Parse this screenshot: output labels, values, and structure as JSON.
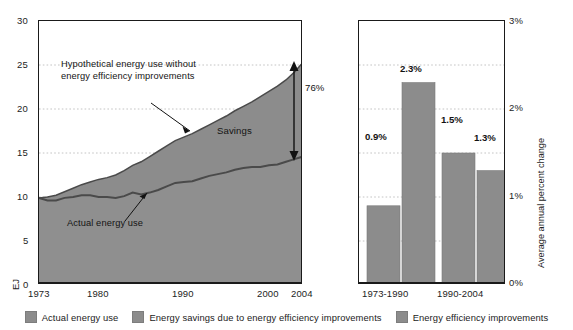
{
  "chart_data": [
    {
      "type": "area",
      "panel": "left",
      "title": "",
      "xlabel": "",
      "ylabel": "EJ",
      "xlim": [
        1973,
        2004
      ],
      "ylim": [
        0,
        30
      ],
      "xticks": [
        "1973",
        "1980",
        "1990",
        "2000",
        "2004"
      ],
      "xtick_values": [
        1973,
        1980,
        1990,
        2000,
        2004
      ],
      "yticks": [
        "0",
        "5",
        "10",
        "15",
        "20",
        "25",
        "30"
      ],
      "ytick_values": [
        0,
        5,
        10,
        15,
        20,
        25,
        30
      ],
      "grid": true,
      "x": [
        1973,
        1974,
        1975,
        1976,
        1977,
        1978,
        1979,
        1980,
        1981,
        1982,
        1983,
        1984,
        1985,
        1986,
        1987,
        1988,
        1989,
        1990,
        1991,
        1992,
        1993,
        1994,
        1995,
        1996,
        1997,
        1998,
        1999,
        2000,
        2001,
        2002,
        2003,
        2004
      ],
      "series": [
        {
          "name": "Actual energy use",
          "color": "#8c8c8c",
          "values": [
            9.9,
            9.6,
            9.6,
            9.9,
            10.0,
            10.2,
            10.2,
            10.0,
            10.0,
            9.9,
            10.1,
            10.5,
            10.3,
            10.5,
            10.8,
            11.2,
            11.6,
            11.7,
            11.8,
            12.1,
            12.4,
            12.6,
            12.8,
            13.1,
            13.3,
            13.4,
            13.4,
            13.6,
            13.7,
            14.0,
            14.3,
            14.6
          ]
        },
        {
          "name": "Hypothetical energy use without energy efficiency improvements",
          "color": "#8c8c8c",
          "values": [
            9.9,
            10.0,
            10.2,
            10.6,
            11.0,
            11.4,
            11.7,
            12.0,
            12.2,
            12.5,
            13.0,
            13.6,
            14.0,
            14.6,
            15.2,
            15.8,
            16.4,
            16.8,
            17.2,
            17.7,
            18.2,
            18.7,
            19.2,
            19.8,
            20.3,
            20.8,
            21.4,
            22.0,
            22.6,
            23.3,
            24.2,
            25.3
          ]
        }
      ],
      "annotations": [
        {
          "name": "hypothetical-label",
          "text": "Hypothetical energy use without\nenergy efficiency improvements",
          "line1": "Hypothetical energy use without",
          "line2": "energy efficiency improvements"
        },
        {
          "name": "actual-label",
          "text": "Actual energy use"
        },
        {
          "name": "savings-label",
          "text": "Savings"
        },
        {
          "name": "savings-percent",
          "text": "76%"
        }
      ]
    },
    {
      "type": "bar",
      "panel": "right",
      "title": "",
      "xlabel": "",
      "ylabel": "Average annual percent change",
      "ylim": [
        0,
        3
      ],
      "yticks": [
        "0%",
        "1%",
        "2%",
        "3%"
      ],
      "ytick_values": [
        0,
        1,
        2,
        3
      ],
      "grid": true,
      "categories": [
        "1973-1990",
        "1990-2004"
      ],
      "series": [
        {
          "name": "Energy savings due to energy efficiency improvements",
          "color": "#8c8c8c",
          "values": [
            0.9,
            1.5
          ],
          "labels": [
            "0.9%",
            "1.5%"
          ]
        },
        {
          "name": "Energy efficiency improvements",
          "color": "#8c8c8c",
          "values": [
            2.3,
            1.3
          ],
          "labels": [
            "2.3%",
            "1.3%"
          ]
        }
      ]
    }
  ],
  "left": {
    "ylabel": "EJ",
    "yticks": [
      "30",
      "25",
      "20",
      "15",
      "10",
      "5",
      "0"
    ],
    "xticks": [
      "1973",
      "1980",
      "1990",
      "2000",
      "2004"
    ],
    "annotations": {
      "hypothetical_line1": "Hypothetical energy use without",
      "hypothetical_line2": "energy efficiency improvements",
      "actual": "Actual energy use",
      "savings": "Savings",
      "savings_percent": "76%"
    }
  },
  "right": {
    "ylabel": "Average annual percent change",
    "yticks": [
      "3%",
      "2%",
      "1%",
      "0%"
    ],
    "xticks": [
      "1973-1990",
      "1990-2004"
    ],
    "bar_labels": [
      "0.9%",
      "2.3%",
      "1.5%",
      "1.3%"
    ]
  },
  "legend": {
    "items": [
      {
        "label": "Actual energy use",
        "color": "#8c8c8c"
      },
      {
        "label": "Energy savings due to energy efficiency improvements",
        "color": "#8c8c8c"
      },
      {
        "label": "Energy efficiency improvements",
        "color": "#8c8c8c"
      }
    ]
  },
  "colors": {
    "fill": "#8c8c8c",
    "line": "#4a4a4a",
    "axis": "#1a1a1a",
    "grid": "#b5b5b5"
  }
}
